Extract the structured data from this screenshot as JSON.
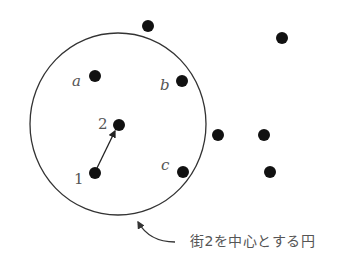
{
  "diagram": {
    "circle": {
      "cx": 118,
      "cy": 124,
      "rx": 88,
      "ry": 91,
      "stroke": "#333333"
    },
    "points": [
      {
        "id": "top-outside",
        "x": 148,
        "y": 26
      },
      {
        "id": "top-right",
        "x": 282,
        "y": 38
      },
      {
        "id": "a",
        "x": 95,
        "y": 76
      },
      {
        "id": "b",
        "x": 182,
        "y": 81
      },
      {
        "id": "town-2",
        "x": 119,
        "y": 125
      },
      {
        "id": "mid-right-1",
        "x": 218,
        "y": 135
      },
      {
        "id": "mid-right-2",
        "x": 264,
        "y": 135
      },
      {
        "id": "town-1",
        "x": 95,
        "y": 173
      },
      {
        "id": "c",
        "x": 183,
        "y": 172
      },
      {
        "id": "bottom-right",
        "x": 270,
        "y": 172
      }
    ],
    "labels": {
      "a": "a",
      "b": "b",
      "c": "c",
      "town1": "1",
      "town2": "2"
    },
    "arrow": {
      "from": "1",
      "to": "2"
    },
    "caption": "街2を中心とする円"
  }
}
